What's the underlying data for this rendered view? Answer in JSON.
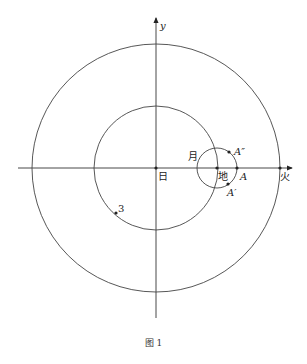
{
  "figure": {
    "caption": "图 1",
    "axes": {
      "x_label": "",
      "y_label": "y"
    },
    "center": {
      "x": 156,
      "y": 168
    },
    "circles": [
      {
        "name": "mars-orbit",
        "r": 124
      },
      {
        "name": "earth-orbit",
        "r": 62
      },
      {
        "name": "moon-orbit",
        "cx": 217,
        "cy": 168,
        "r": 20
      }
    ],
    "labels": {
      "sun": "日",
      "earth": "地",
      "moon": "月",
      "mars": "火",
      "A": "A",
      "A_prime": "A′",
      "A_double_prime": "A″",
      "point3": "3",
      "y": "y"
    }
  }
}
